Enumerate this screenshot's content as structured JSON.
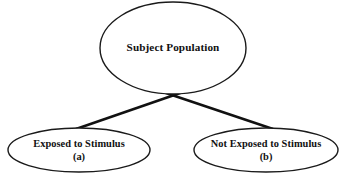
{
  "diagram": {
    "type": "tree",
    "colors": {
      "background": "#ffffff",
      "stroke": "#1a1a1a",
      "line": "#111111",
      "text": "#111111"
    },
    "nodes": [
      {
        "id": "root",
        "shape": "ellipse",
        "label": "Subject Population",
        "sublabel": "",
        "cx": 173,
        "cy": 48,
        "rx": 73,
        "ry": 46,
        "stroke_width": 1.4
      },
      {
        "id": "exposed",
        "shape": "ellipse",
        "label": "Exposed to Stimulus",
        "sublabel": "(a)",
        "cx": 79,
        "cy": 150,
        "rx": 71,
        "ry": 22,
        "stroke_width": 1.4
      },
      {
        "id": "not-exposed",
        "shape": "ellipse",
        "label": "Not Exposed to Stimulus",
        "sublabel": "(b)",
        "cx": 266,
        "cy": 150,
        "rx": 72,
        "ry": 22,
        "stroke_width": 1.4
      }
    ],
    "edges": [
      {
        "id": "root-to-exposed",
        "from": "root",
        "to": "exposed",
        "x1": 183,
        "y1": 92,
        "x2": 76,
        "y2": 129,
        "stroke_width": 2.6
      },
      {
        "id": "root-to-not-exposed",
        "from": "root",
        "to": "not-exposed",
        "x1": 163,
        "y1": 92,
        "x2": 273,
        "y2": 129,
        "stroke_width": 2.6
      }
    ]
  }
}
